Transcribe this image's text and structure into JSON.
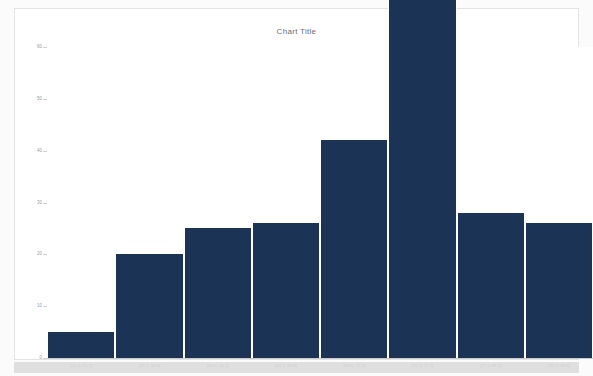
{
  "chart": {
    "title": "Chart Title"
  },
  "chart_data": {
    "type": "bar",
    "title": "Chart Title",
    "xlabel": "",
    "ylabel": "",
    "grid": false,
    "legend": null,
    "ylim": [
      0,
      60
    ],
    "yticks": [
      0,
      10,
      20,
      30,
      40,
      50,
      60
    ],
    "ytick_labels": [
      "0",
      "10",
      "20",
      "30",
      "40",
      "50",
      "60"
    ],
    "categories": [
      "(51.4, 55.7]",
      "(55.7, 60.0]",
      "(60.0, 64.2]",
      "(64.2, 68.6]",
      "(68.6, 72.9]",
      "(72.9, 77.2]",
      "(77.2, 81.5]",
      "(81.5, 85.8]"
    ],
    "values": [
      5,
      20,
      25,
      26,
      42,
      69,
      28,
      26
    ],
    "bar_color": "#1b3354"
  },
  "colors": {
    "bar": "#1b3354",
    "card_background": "#ffffff",
    "card_border": "#e3e3e3",
    "page_background": "#fbfbfb",
    "bottom_strip": "#d9d9d9",
    "axis": "#cfcfcf",
    "tick_text": "#9a9a9a",
    "title_text": "#6e6e6e"
  }
}
